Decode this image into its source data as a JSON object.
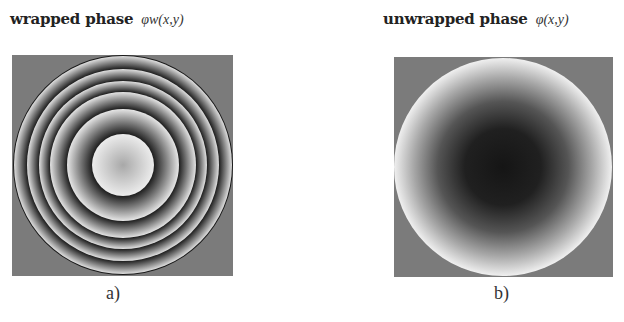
{
  "figure": {
    "panel_a": {
      "title": "wrapped phase",
      "symbol": "φw(x,y)",
      "caption": "a)",
      "description": "concentric wrapped phase fringes",
      "ring_boundary_radii_px": [
        31,
        56,
        73,
        84,
        96,
        109
      ]
    },
    "panel_b": {
      "title": "unwrapped phase",
      "symbol": "φ(x,y)",
      "caption": "b)",
      "description": "smooth radial phase: dark center to bright rim"
    },
    "colors": {
      "background_gray": "#7b7b7b",
      "fringe_dark": "#1e1e1e",
      "fringe_bright": "#e6e6e6",
      "center_dark": "#151515",
      "rim_bright": "#f0f0f0"
    }
  }
}
